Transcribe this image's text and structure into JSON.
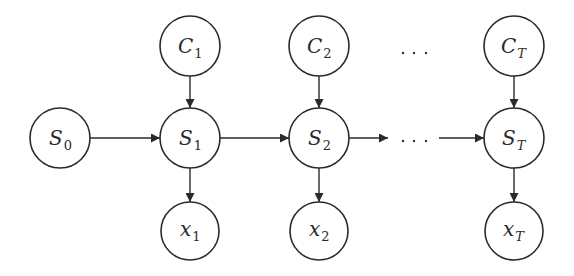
{
  "diagram": {
    "type": "hidden-markov-chain",
    "colors": {
      "stroke": "#2a2a2a",
      "background": "#ffffff"
    },
    "nodes": {
      "S0": {
        "main": "S",
        "sub": "0",
        "sub_italic": false,
        "cx": 60,
        "cy": 138,
        "r": 30
      },
      "S1": {
        "main": "S",
        "sub": "1",
        "sub_italic": false,
        "cx": 190,
        "cy": 138,
        "r": 30
      },
      "S2": {
        "main": "S",
        "sub": "2",
        "sub_italic": false,
        "cx": 319,
        "cy": 138,
        "r": 30
      },
      "ST": {
        "main": "S",
        "sub": "T",
        "sub_italic": true,
        "cx": 514,
        "cy": 138,
        "r": 30
      },
      "C1": {
        "main": "C",
        "sub": "1",
        "sub_italic": false,
        "cx": 190,
        "cy": 46,
        "r": 30
      },
      "C2": {
        "main": "C",
        "sub": "2",
        "sub_italic": false,
        "cx": 319,
        "cy": 46,
        "r": 30
      },
      "CT": {
        "main": "C",
        "sub": "T",
        "sub_italic": true,
        "cx": 514,
        "cy": 46,
        "r": 30
      },
      "x1": {
        "main": "x",
        "sub": "1",
        "sub_italic": false,
        "cx": 191,
        "cy": 231,
        "r": 29
      },
      "x2": {
        "main": "x",
        "sub": "2",
        "sub_italic": false,
        "cx": 319,
        "cy": 231,
        "r": 29
      },
      "xT": {
        "main": "x",
        "sub": "T",
        "sub_italic": true,
        "cx": 514,
        "cy": 231,
        "r": 29
      }
    },
    "edges": [
      {
        "from": "S0",
        "to": "S1"
      },
      {
        "from": "S1",
        "to": "S2"
      },
      {
        "from": "S2",
        "to": "ellipsis"
      },
      {
        "from": "ellipsis",
        "to": "ST"
      },
      {
        "from": "C1",
        "to": "S1"
      },
      {
        "from": "C2",
        "to": "S2"
      },
      {
        "from": "CT",
        "to": "ST"
      },
      {
        "from": "S1",
        "to": "x1"
      },
      {
        "from": "S2",
        "to": "x2"
      },
      {
        "from": "ST",
        "to": "xT"
      }
    ],
    "ellipsis_top": "…",
    "ellipsis_middle": "…"
  }
}
